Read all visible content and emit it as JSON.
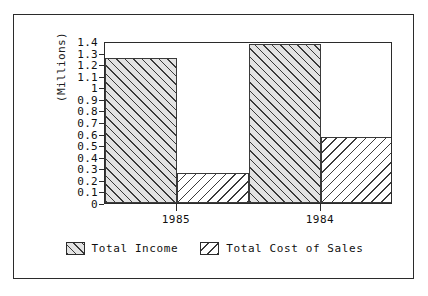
{
  "chart_data": {
    "type": "bar",
    "title": "",
    "xlabel": "",
    "ylabel": "(Millions)",
    "categories": [
      "1985",
      "1984"
    ],
    "series": [
      {
        "name": "Total Income",
        "values": [
          1.25,
          1.37
        ],
        "hatch": "forward-diagonal",
        "fill": "#e3e3e3"
      },
      {
        "name": "Total Cost of Sales",
        "values": [
          0.26,
          0.57
        ],
        "hatch": "back-diagonal",
        "fill": "#ffffff"
      }
    ],
    "ylim": [
      0,
      1.4
    ],
    "ytick_step": 0.1,
    "ytick_labels": [
      "1.4",
      "1.3",
      "1.2",
      "1.1",
      "1",
      "0.9",
      "0.8",
      "0.7",
      "0.6",
      "0.5",
      "0.4",
      "0.3",
      "0.2",
      "0.1",
      "0"
    ],
    "grid": false,
    "legend_position": "bottom"
  },
  "legend": {
    "entries": [
      {
        "label": "Total Income"
      },
      {
        "label": "Total Cost of Sales"
      }
    ]
  },
  "colors": {
    "line": "#2b2b2b",
    "text": "#101010",
    "background": "#ffffff",
    "series_one_fill": "#e3e3e3",
    "series_two_fill": "#ffffff"
  }
}
